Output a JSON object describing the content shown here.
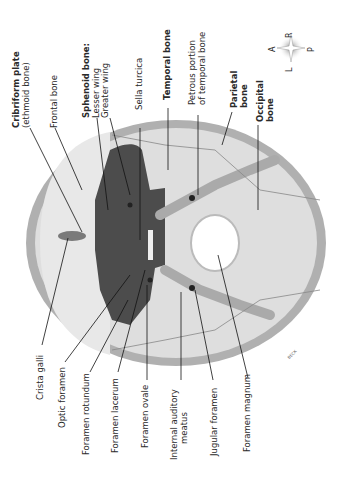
{
  "diagram": {
    "palette": {
      "bone_outer": "#a8a8a8",
      "bone_light": "#dcdcdc",
      "sphenoid": "#4a4a4a",
      "foramen_magnum": "#ffffff",
      "line": "#111111"
    },
    "labels_top": [
      {
        "id": "cribriform",
        "bold": "Cribriform plate",
        "normal": "(ethmoid bone)"
      },
      {
        "id": "frontal",
        "bold": "",
        "normal": "Frontal bone"
      },
      {
        "id": "sphenoid",
        "bold": "Sphenoid bone:",
        "normal": "Lesser wing",
        "normal2": "Greater wing"
      },
      {
        "id": "sella",
        "bold": "",
        "normal": "Sella turcica"
      },
      {
        "id": "temporal",
        "bold": "Temporal bone",
        "normal": ""
      },
      {
        "id": "petrous",
        "bold": "",
        "normal": "Petrous portion",
        "normal2": "of temporal bone"
      },
      {
        "id": "parietal",
        "bold": "Parietal",
        "normal": "",
        "bold2": "bone"
      },
      {
        "id": "occipital",
        "bold": "Occipital",
        "normal": "",
        "bold2": "bone"
      }
    ],
    "labels_bottom": [
      {
        "id": "crista",
        "normal": "Crista galli"
      },
      {
        "id": "optic",
        "normal": "Optic foramen"
      },
      {
        "id": "rotundum",
        "normal": "Foramen rotundum"
      },
      {
        "id": "lacerum",
        "normal": "Foramen lacerum"
      },
      {
        "id": "ovale",
        "normal": "Foramen ovale"
      },
      {
        "id": "auditory",
        "normal": "Internal auditory",
        "normal2": "meatus"
      },
      {
        "id": "jugular",
        "normal": "Jugular foramen"
      },
      {
        "id": "magnum",
        "normal": "Foramen magnum"
      }
    ],
    "compass": {
      "a": "A",
      "p": "P",
      "r": "R",
      "l": "L"
    },
    "signature": "BECK"
  }
}
